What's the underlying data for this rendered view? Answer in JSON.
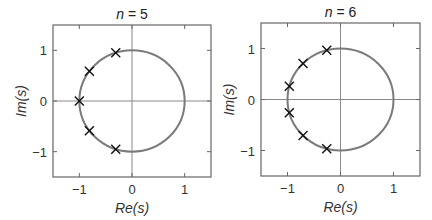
{
  "chart_data": [
    {
      "type": "scatter",
      "title": "n = 5",
      "title_var": "n",
      "title_value": "5",
      "xlabel": "Re(s)",
      "ylabel": "Im(s)",
      "xlim": [
        -1.5,
        1.5
      ],
      "ylim": [
        -1.5,
        1.5
      ],
      "xticks": [
        -1,
        0,
        1
      ],
      "yticks": [
        -1,
        0,
        1
      ],
      "xtick_labels": [
        "−1",
        "0",
        "1"
      ],
      "ytick_labels": [
        "−1",
        "0",
        "1"
      ],
      "grid": false,
      "reference_lines": {
        "x": 0,
        "y": 0
      },
      "unit_circle": {
        "radius": 1,
        "color": "#7a7a7a"
      },
      "marker": "x",
      "points": [
        {
          "x": -0.309,
          "y": 0.951
        },
        {
          "x": -0.809,
          "y": 0.588
        },
        {
          "x": -1.0,
          "y": 0.0
        },
        {
          "x": -0.809,
          "y": -0.588
        },
        {
          "x": -0.309,
          "y": -0.951
        }
      ]
    },
    {
      "type": "scatter",
      "title": "n = 6",
      "title_var": "n",
      "title_value": "6",
      "xlabel": "Re(s)",
      "ylabel": "Im(s)",
      "xlim": [
        -1.5,
        1.5
      ],
      "ylim": [
        -1.5,
        1.5
      ],
      "xticks": [
        -1,
        0,
        1
      ],
      "yticks": [
        -1,
        0,
        1
      ],
      "xtick_labels": [
        "−1",
        "0",
        "1"
      ],
      "ytick_labels": [
        "−1",
        "0",
        "1"
      ],
      "grid": false,
      "reference_lines": {
        "x": 0,
        "y": 0
      },
      "unit_circle": {
        "radius": 1,
        "color": "#7a7a7a"
      },
      "marker": "x",
      "points": [
        {
          "x": -0.259,
          "y": 0.966
        },
        {
          "x": -0.707,
          "y": 0.707
        },
        {
          "x": -0.966,
          "y": 0.259
        },
        {
          "x": -0.966,
          "y": -0.259
        },
        {
          "x": -0.707,
          "y": -0.707
        },
        {
          "x": -0.259,
          "y": -0.966
        }
      ]
    }
  ],
  "layout": {
    "panels": [
      {
        "left": 53,
        "top": 25,
        "right": 211,
        "bottom": 177
      },
      {
        "left": 261,
        "top": 23,
        "right": 420,
        "bottom": 176
      }
    ],
    "colors": {
      "frame": "#666666",
      "axis": "#8a8a8a",
      "circle": "#7a7a7a",
      "marker": "#111111",
      "text": "#333333"
    }
  }
}
